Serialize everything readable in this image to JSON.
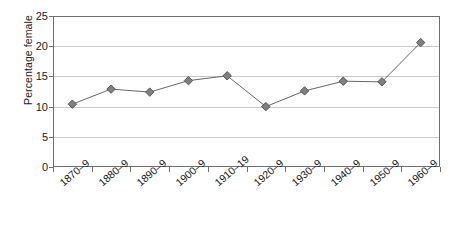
{
  "chart_data": {
    "type": "line",
    "title": "",
    "xlabel": "",
    "ylabel": "Percentage female",
    "categories": [
      "1870–9",
      "1880–9",
      "1890–9",
      "1900–9",
      "1910–19",
      "1920–9",
      "1930–9",
      "1940–9",
      "1950–9",
      "1960–9"
    ],
    "values": [
      10.4,
      12.9,
      12.4,
      14.3,
      15.1,
      10.0,
      12.6,
      14.2,
      14.1,
      20.6
    ],
    "series": [
      {
        "name": "Percentage female",
        "values": [
          10.4,
          12.9,
          12.4,
          14.3,
          15.1,
          10.0,
          12.6,
          14.2,
          14.1,
          20.6
        ]
      }
    ],
    "ylim": [
      0,
      25
    ],
    "yticks": [
      0,
      5,
      10,
      15,
      20,
      25
    ],
    "ytick_labels": [
      "0",
      "5",
      "10",
      "15",
      "20",
      "25"
    ],
    "grid": "horizontal",
    "legend": "none",
    "marker": "diamond",
    "marker_color": "#808080",
    "marker_edge_color": "#555555",
    "line_color": "#666666",
    "gridline_color": "#c8c8c8",
    "axis_color": "#6e6e6e",
    "background_color": "#ffffff"
  }
}
